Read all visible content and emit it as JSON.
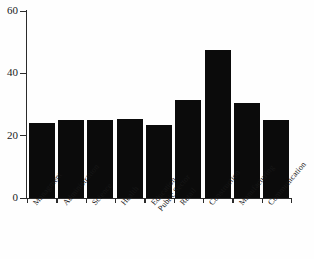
{
  "chart_data": {
    "type": "bar",
    "title": "",
    "subtitle": "",
    "xlabel": "",
    "ylabel": "",
    "categories": [
      "Managment",
      "Administration",
      "Science",
      "Health",
      "Education Public Sector",
      "Retail",
      "Construction",
      "Manufacturing",
      "Communication"
    ],
    "values": [
      24,
      25,
      25,
      25.5,
      23.5,
      31.5,
      47.5,
      30.5,
      25
    ],
    "ylim": [
      0,
      60
    ],
    "yticks": [
      0,
      20,
      40,
      60
    ],
    "ytick_labels": [
      "0",
      "20",
      "40",
      "60"
    ],
    "grid": false,
    "legend": false,
    "bar_color": "#0b0b0b",
    "axis_color": "#2b2b2b",
    "background": "#ffffff"
  }
}
